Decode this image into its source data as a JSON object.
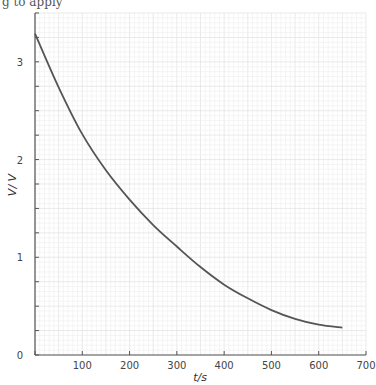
{
  "header_fragment": "g to apply",
  "chart_data": {
    "type": "line",
    "title": "",
    "xlabel": "t/s",
    "ylabel": "V/ V",
    "xlim": [
      0,
      700
    ],
    "ylim": [
      0,
      3.5
    ],
    "xticks": [
      0,
      100,
      200,
      300,
      400,
      500,
      600,
      700
    ],
    "xtick_labels": [
      "",
      "100",
      "200",
      "300",
      "400",
      "500",
      "600",
      "700"
    ],
    "yticks": [
      0,
      1,
      2,
      3
    ],
    "ytick_labels": [
      "0",
      "1",
      "2",
      "3"
    ],
    "origin_label": "0",
    "grid": true,
    "series": [
      {
        "name": "V",
        "color": "#555555",
        "x": [
          0,
          50,
          100,
          150,
          200,
          250,
          300,
          350,
          400,
          450,
          500,
          550,
          600,
          650
        ],
        "y": [
          3.29,
          2.74,
          2.26,
          1.89,
          1.59,
          1.33,
          1.11,
          0.9,
          0.72,
          0.58,
          0.46,
          0.37,
          0.31,
          0.28
        ]
      }
    ]
  }
}
